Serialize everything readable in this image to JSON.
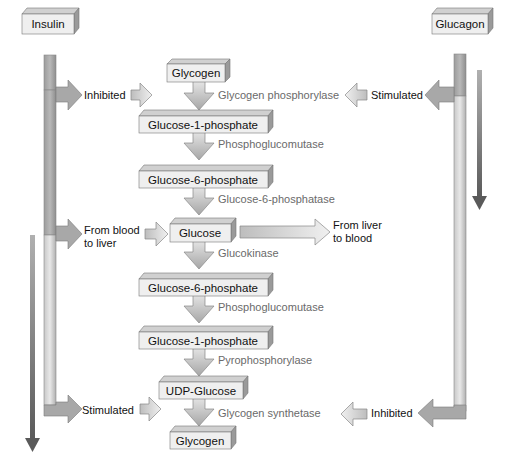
{
  "hormones": {
    "insulin": "Insulin",
    "glucagon": "Glucagon"
  },
  "pathway_boxes": [
    "Glycogen",
    "Glucose-1-phosphate",
    "Glucose-6-phosphate",
    "Glucose",
    "Glucose-6-phosphate",
    "Glucose-1-phosphate",
    "UDP-Glucose",
    "Glycogen"
  ],
  "enzymes": [
    "Glycogen phosphorylase",
    "Phosphoglucomutase",
    "Glucose-6-phosphatase",
    "Glucokinase",
    "Phosphoglucomutase",
    "Pyrophosphorylase",
    "Glycogen synthetase"
  ],
  "insulin_effects": {
    "top": "Inhibited",
    "middle_line1": "From blood",
    "middle_line2": "to liver",
    "bottom": "Stimulated"
  },
  "glucagon_effects": {
    "top": "Stimulated",
    "bottom": "Inhibited"
  },
  "glucose_export": {
    "line1": "From liver",
    "line2": "to blood"
  },
  "colors": {
    "box_face": "#eeeeee",
    "box_side": "#9a9a9a",
    "enzyme_text": "#6a6a6a",
    "trend_arrow": "#6e6e6e"
  }
}
